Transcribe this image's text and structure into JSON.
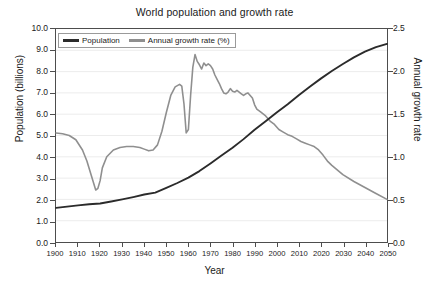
{
  "chart_data": {
    "type": "line",
    "title": "World population and growth rate",
    "xlabel": "Year",
    "ylabel": "Population (billions)",
    "ylabel_right": "Annual growth rate",
    "xlim": [
      1900,
      2050
    ],
    "ylim": [
      0.0,
      10.0
    ],
    "ylim_right": [
      0.0,
      2.5
    ],
    "grid": true,
    "legend_position": "upper left",
    "xticks": [
      1900,
      1910,
      1920,
      1930,
      1940,
      1950,
      1960,
      1970,
      1980,
      1990,
      2000,
      2010,
      2020,
      2030,
      2040,
      2050
    ],
    "yticks_left": [
      "0.0",
      "1.0",
      "2.0",
      "3.0",
      "4.0",
      "5.0",
      "6.0",
      "7.0",
      "8.0",
      "9.0",
      "10.0"
    ],
    "yticks_right": [
      "0.0",
      "0.5",
      "1.0",
      "1.5",
      "2.0",
      "2.5"
    ],
    "series": [
      {
        "name": "Population",
        "axis": "left",
        "unit": "billions",
        "color": "#2b2b2b",
        "x": [
          1900,
          1905,
          1910,
          1915,
          1920,
          1925,
          1930,
          1935,
          1940,
          1945,
          1950,
          1955,
          1960,
          1965,
          1970,
          1975,
          1980,
          1985,
          1990,
          1995,
          2000,
          2005,
          2010,
          2015,
          2020,
          2025,
          2030,
          2035,
          2040,
          2045,
          2050
        ],
        "values": [
          1.6,
          1.66,
          1.72,
          1.77,
          1.81,
          1.9,
          2.0,
          2.11,
          2.23,
          2.32,
          2.54,
          2.77,
          3.02,
          3.33,
          3.69,
          4.06,
          4.43,
          4.83,
          5.27,
          5.67,
          6.08,
          6.47,
          6.89,
          7.29,
          7.67,
          8.03,
          8.36,
          8.67,
          8.94,
          9.15,
          9.3
        ]
      },
      {
        "name": "Annual growth rate (%)",
        "axis": "right",
        "unit": "percent",
        "color": "#8f8f8f",
        "x": [
          1900,
          1903,
          1906,
          1909,
          1912,
          1914,
          1916,
          1918,
          1919,
          1920,
          1921,
          1923,
          1926,
          1929,
          1932,
          1935,
          1938,
          1940,
          1942,
          1944,
          1946,
          1948,
          1950,
          1952,
          1954,
          1956,
          1957,
          1958,
          1959,
          1960,
          1961,
          1962,
          1963,
          1964,
          1965,
          1966,
          1967,
          1968,
          1969,
          1970,
          1971,
          1972,
          1973,
          1974,
          1975,
          1976,
          1977,
          1978,
          1979,
          1980,
          1981,
          1982,
          1983,
          1984,
          1985,
          1986,
          1987,
          1988,
          1989,
          1990,
          1991,
          1993,
          1995,
          1997,
          1999,
          2001,
          2003,
          2005,
          2007,
          2009,
          2011,
          2013,
          2015,
          2017,
          2019,
          2021,
          2023,
          2025,
          2030,
          2035,
          2040,
          2045,
          2050
        ],
        "values": [
          1.28,
          1.27,
          1.25,
          1.2,
          1.08,
          0.95,
          0.78,
          0.61,
          0.63,
          0.72,
          0.87,
          1.0,
          1.08,
          1.11,
          1.12,
          1.12,
          1.11,
          1.09,
          1.07,
          1.08,
          1.14,
          1.3,
          1.52,
          1.72,
          1.82,
          1.85,
          1.83,
          1.62,
          1.28,
          1.32,
          1.72,
          2.05,
          2.2,
          2.12,
          2.08,
          2.03,
          2.1,
          2.07,
          2.09,
          2.07,
          2.03,
          1.96,
          1.91,
          1.86,
          1.8,
          1.75,
          1.74,
          1.76,
          1.8,
          1.77,
          1.76,
          1.78,
          1.76,
          1.74,
          1.72,
          1.74,
          1.75,
          1.72,
          1.69,
          1.61,
          1.56,
          1.52,
          1.48,
          1.42,
          1.38,
          1.32,
          1.29,
          1.26,
          1.24,
          1.21,
          1.18,
          1.16,
          1.14,
          1.12,
          1.08,
          1.02,
          0.95,
          0.9,
          0.79,
          0.71,
          0.64,
          0.57,
          0.5
        ]
      }
    ],
    "annotations": [
      "Growth rate peaks near 2.2% in 1963",
      "Sharp dip to about 1.28% in 1959-1960",
      "Influenza/WWI trough near 0.61% in 1918",
      "Series cross near 1995 at 6 billion / 1.5%"
    ]
  },
  "legend": {
    "items": [
      {
        "label": "Population",
        "color": "#2b2b2b"
      },
      {
        "label": "Annual growth rate (%)",
        "color": "#8f8f8f"
      }
    ]
  }
}
